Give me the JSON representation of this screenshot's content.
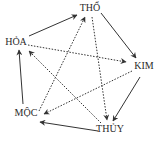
{
  "diagram": {
    "title": "",
    "nodes": [
      {
        "id": "tho",
        "label": "THỔ",
        "x": 90,
        "y": 8
      },
      {
        "id": "kim",
        "label": "KIM",
        "x": 144,
        "y": 66
      },
      {
        "id": "thuy",
        "label": "THỦY",
        "x": 110,
        "y": 129
      },
      {
        "id": "moc",
        "label": "MỘC",
        "x": 26,
        "y": 113
      },
      {
        "id": "hoa",
        "label": "HỎA",
        "x": 16,
        "y": 42
      }
    ],
    "edges_solid": [
      {
        "from": "hoa",
        "to": "tho"
      },
      {
        "from": "tho",
        "to": "kim"
      },
      {
        "from": "kim",
        "to": "thuy"
      },
      {
        "from": "thuy",
        "to": "moc"
      },
      {
        "from": "moc",
        "to": "hoa"
      }
    ],
    "edges_dotted": [
      {
        "from": "hoa",
        "to": "kim"
      },
      {
        "from": "kim",
        "to": "moc"
      },
      {
        "from": "moc",
        "to": "tho"
      },
      {
        "from": "tho",
        "to": "thuy"
      },
      {
        "from": "thuy",
        "to": "hoa"
      }
    ],
    "colors": {
      "line": "#333333",
      "text": "#2a2a2a",
      "background": "#ffffff"
    }
  }
}
